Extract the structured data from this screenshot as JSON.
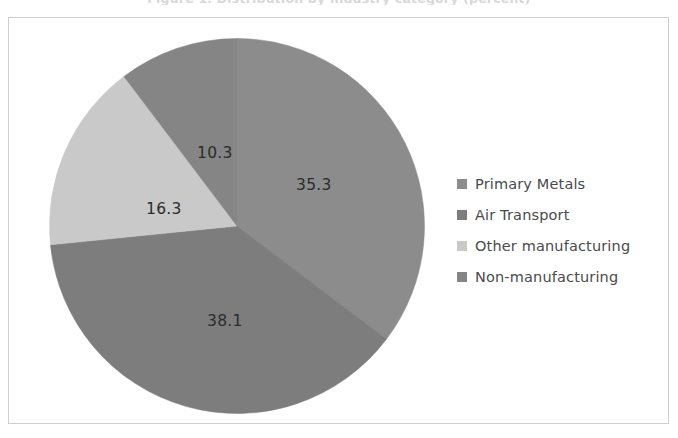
{
  "clipped_caption": "Figure 1. Distribution by industry category (percent)",
  "frame": {
    "border_color": "#cfcfcf",
    "background": "#ffffff"
  },
  "legend": {
    "position": "right",
    "items": [
      {
        "label": "Primary Metals",
        "color": "#8c8c8c",
        "marker": "square-swatch"
      },
      {
        "label": "Air Transport",
        "color": "#7d7d7d",
        "marker": "square-swatch"
      },
      {
        "label": "Other manufacturing",
        "color": "#c9c9c9",
        "marker": "square-swatch"
      },
      {
        "label": "Non-manufacturing",
        "color": "#858585",
        "marker": "square-swatch"
      }
    ]
  },
  "chart_data": {
    "type": "pie",
    "title": "",
    "subtitle": "",
    "xlabel": "",
    "ylabel": "",
    "grid": false,
    "legend_position": "right",
    "start_angle_deg": 0,
    "direction": "clockwise",
    "categories": [
      "Primary Metals",
      "Air Transport",
      "Other manufacturing",
      "Non-manufacturing"
    ],
    "values": [
      35.3,
      38.1,
      16.3,
      10.3
    ],
    "value_labels": [
      "35.3",
      "38.1",
      "16.3",
      "10.3"
    ],
    "colors": [
      "#8c8c8c",
      "#7d7d7d",
      "#c9c9c9",
      "#858585"
    ],
    "total": 100.0,
    "units": "percent"
  }
}
